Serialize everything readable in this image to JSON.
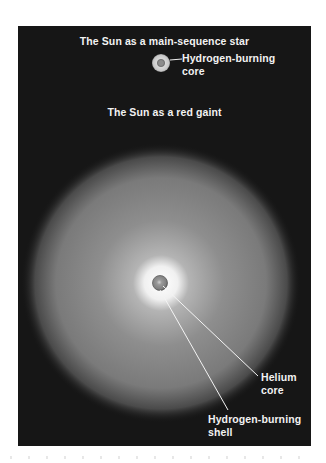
{
  "figure": {
    "title_main_sequence": "The Sun as a main-sequence star",
    "title_red_giant": "The Sun as a red gaint",
    "labels": {
      "hydrogen_burning_core": [
        "Hydrogen-burning",
        "core"
      ],
      "helium_core": [
        "Helium",
        "core"
      ],
      "hydrogen_burning_shell": [
        "Hydrogen-burning",
        "shell"
      ]
    },
    "colors": {
      "background": "#161616",
      "text": "#f2f2f2",
      "giant_glow_outer": "#7a7a7a",
      "giant_glow_inner": "#f5f5f5",
      "core_fill": "#8c8c8c",
      "leader_line": "#f0f0f0"
    }
  }
}
